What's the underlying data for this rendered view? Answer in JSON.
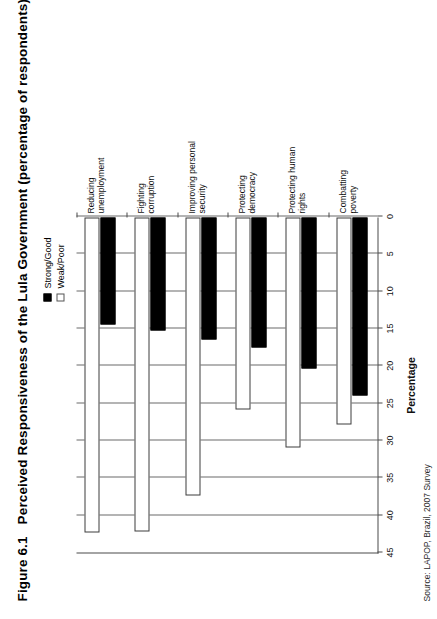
{
  "figure": {
    "number": "Figure 6.1",
    "title": "Perceived Responsiveness of the Lula Government (percentage of respondents)",
    "source": "Source: LAPOP, Brazil, 2007 Survey"
  },
  "legend": {
    "position": "top-right",
    "items": [
      {
        "label": "Strong/Good",
        "style": "solid",
        "color": "#000000"
      },
      {
        "label": "Weak/Poor",
        "style": "hollow",
        "color": "#ffffff"
      }
    ]
  },
  "chart_data": {
    "type": "bar",
    "orientation": "horizontal",
    "title": "Perceived Responsiveness of the Lula Government (percentage of respondents)",
    "xlabel": "",
    "ylabel": "Percentage",
    "ylim": [
      0,
      45
    ],
    "grid": true,
    "tick_labels": [
      "45",
      "40",
      "35",
      "30",
      "25",
      "20",
      "15",
      "10",
      "5",
      "0"
    ],
    "tick_values": [
      45,
      40,
      35,
      30,
      25,
      20,
      15,
      10,
      5,
      0
    ],
    "categories": [
      "Combatting poverty",
      "Protecting human rights",
      "Protecting democracy",
      "Improving personal security",
      "Fighting corruption",
      "Reducing unemployment"
    ],
    "series": [
      {
        "name": "Strong/Good",
        "values": [
          23.8,
          20.2,
          17.4,
          16.3,
          15.1,
          14.3
        ]
      },
      {
        "name": "Weak/Poor",
        "values": [
          27.7,
          30.8,
          25.7,
          37.2,
          42.0,
          42.2
        ]
      }
    ]
  }
}
